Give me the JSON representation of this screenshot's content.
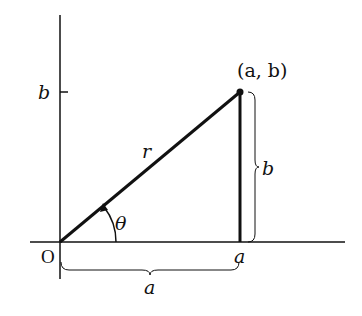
{
  "diagram": {
    "labels": {
      "origin": "O",
      "point": "(a, b)",
      "radius": "r",
      "angle": "θ",
      "y_tick": "b",
      "x_tick": "a",
      "vertical_brace": "b",
      "horizontal_brace": "a"
    },
    "colors": {
      "stroke": "#111111",
      "background": "#ffffff"
    }
  }
}
